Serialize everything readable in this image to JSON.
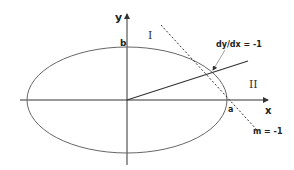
{
  "diagram": {
    "type": "ellipse-tangent",
    "axes": {
      "x_label": "x",
      "y_label": "y"
    },
    "ellipse": {
      "semi_major_label": "a",
      "semi_minor_label": "b"
    },
    "regions": {
      "region1": "I",
      "region2": "II"
    },
    "annotations": {
      "tangent_point": "dy/dx = -1",
      "tangent_slope": "m = -1"
    },
    "colors": {
      "stroke": "#333333",
      "ellipse": "#555555",
      "background": "#ffffff"
    }
  }
}
